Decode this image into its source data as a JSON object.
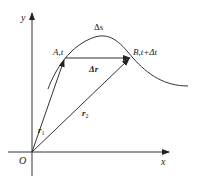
{
  "diagram": {
    "axes": {
      "x_label": "x",
      "y_label": "y",
      "origin_label": "O"
    },
    "points": {
      "A": {
        "label": "A,t"
      },
      "B": {
        "label": "B,t+Δt"
      }
    },
    "vectors": {
      "r1": {
        "label_main": "r",
        "label_sub": "1"
      },
      "r2": {
        "label_main": "r",
        "label_sub": "2"
      },
      "dr": {
        "label": "Δr"
      }
    },
    "path": {
      "label": "Δs"
    },
    "colors": {
      "stroke": "#333333",
      "text": "#222222",
      "background": "#ffffff"
    }
  }
}
